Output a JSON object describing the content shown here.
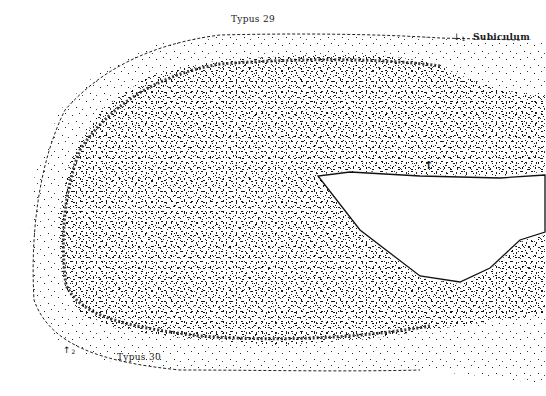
{
  "figure": {
    "labels": {
      "top": "Typus 29",
      "bottom": "Typus 30",
      "region": "Subiculum"
    },
    "markers": [
      {
        "id": "marker-1",
        "glyph": "↓",
        "index": "1"
      },
      {
        "id": "marker-2",
        "glyph": "↑",
        "index": "2"
      },
      {
        "id": "marker-inner",
        "glyph": "↑"
      }
    ],
    "colors": {
      "ink": "#111111",
      "background": "#ffffff"
    }
  }
}
